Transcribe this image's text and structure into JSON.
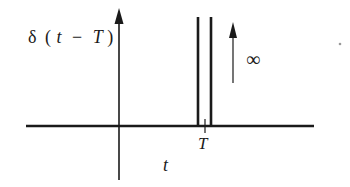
{
  "diagram": {
    "function_label": {
      "delta": "δ",
      "open": "(",
      "var": "t",
      "minus": "−",
      "shift": "T",
      "close": ")"
    },
    "infinity_label": "∞",
    "x_axis_label": "t",
    "tick_label": "T",
    "colors": {
      "ink": "#1a1a1a",
      "background": "#ffffff"
    }
  }
}
